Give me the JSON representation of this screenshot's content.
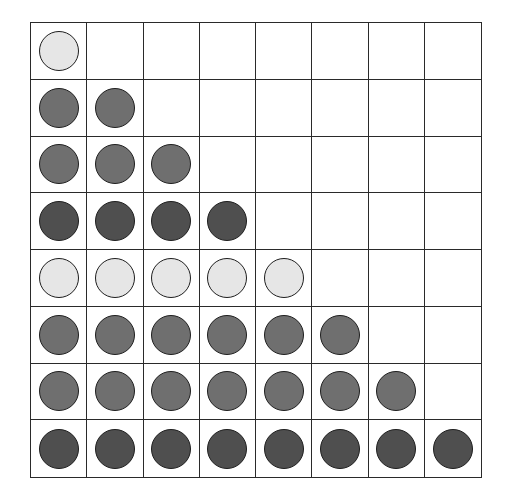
{
  "diagram": {
    "type": "triangular-dot-grid",
    "rows": 8,
    "cols": 8,
    "fill_colors": {
      "light": "#e6e6e6",
      "medium": "#6f6f6f",
      "dark": "#4f4f4f"
    },
    "grid_line_color": "#2a2a2a",
    "row_data": [
      {
        "row": 1,
        "count": 1,
        "shade": "light"
      },
      {
        "row": 2,
        "count": 2,
        "shade": "medium"
      },
      {
        "row": 3,
        "count": 3,
        "shade": "medium"
      },
      {
        "row": 4,
        "count": 4,
        "shade": "dark"
      },
      {
        "row": 5,
        "count": 5,
        "shade": "light"
      },
      {
        "row": 6,
        "count": 6,
        "shade": "medium"
      },
      {
        "row": 7,
        "count": 7,
        "shade": "medium"
      },
      {
        "row": 8,
        "count": 8,
        "shade": "dark"
      }
    ],
    "total_circles": 36
  }
}
